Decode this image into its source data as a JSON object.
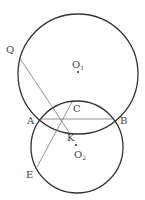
{
  "diagram": {
    "circles": [
      {
        "name": "O1",
        "cx": 78,
        "cy": 74,
        "r": 60,
        "stroke": "#333333"
      },
      {
        "name": "O2",
        "cx": 77,
        "cy": 147,
        "r": 46,
        "stroke": "#333333"
      }
    ],
    "points": {
      "Q": {
        "x": 19,
        "y": 57
      },
      "A": {
        "x": 40,
        "y": 119
      },
      "B": {
        "x": 114,
        "y": 119
      },
      "C": {
        "x": 72,
        "y": 102
      },
      "K": {
        "x": 69,
        "y": 132
      },
      "E": {
        "x": 37,
        "y": 167
      },
      "O1": {
        "x": 78,
        "y": 72
      },
      "O2": {
        "x": 76,
        "y": 145
      }
    },
    "labels": {
      "Q": "Q",
      "A": "A",
      "B": "B",
      "C": "C",
      "K": "K",
      "E": "E",
      "O1_main": "O",
      "O1_sub": "1",
      "O2_main": "O",
      "O2_sub": "2"
    },
    "line_color": "#777777"
  }
}
